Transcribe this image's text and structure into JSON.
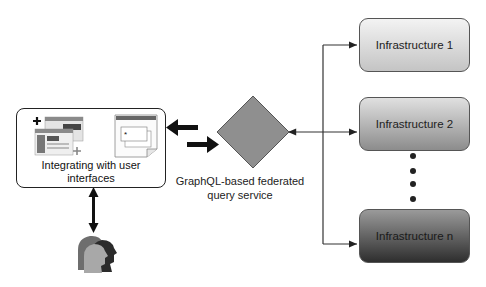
{
  "diagram": {
    "ui_box": {
      "label": "Integrating with user interfaces",
      "icons": [
        "browser-windows-icon",
        "widget-document-icon"
      ],
      "widget_header": "WIDGET"
    },
    "central_node": {
      "shape": "diamond",
      "label_line1": "GraphQL-based federated",
      "label_line2": "query service",
      "fill": "#8f8f8f"
    },
    "infrastructures": [
      {
        "label": "Infrastructure 1",
        "fill_top": "#f3f3f3",
        "fill_bottom": "#c4c4c4"
      },
      {
        "label": "Infrastructure 2",
        "fill_top": "#e0e0e0",
        "fill_bottom": "#8c8c8c"
      },
      {
        "label": "Infrastructure n",
        "fill_top": "#9a9a9a",
        "fill_bottom": "#2e2e2e"
      }
    ],
    "ellipsis_dots": 4,
    "users_icon": "users-group-icon",
    "connections": [
      {
        "from": "central_node",
        "to": "ui_box",
        "style": "thick-arrow"
      },
      {
        "from": "ui_box",
        "to": "central_node",
        "style": "thick-arrow"
      },
      {
        "from": "central_node",
        "to": "infrastructures",
        "style": "bidirectional-thin-arrow"
      },
      {
        "from": "ui_box",
        "to": "users",
        "style": "bidirectional-arrow"
      }
    ]
  }
}
